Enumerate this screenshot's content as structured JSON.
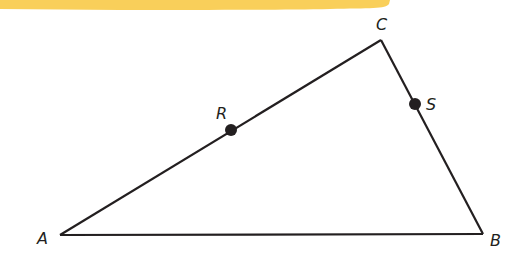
{
  "figure": {
    "type": "triangle",
    "banner_color": "#F9CF5A",
    "stroke_color": "#231f20",
    "vertices": [
      {
        "id": "A",
        "label": "A",
        "x": 60,
        "y": 235
      },
      {
        "id": "B",
        "label": "B",
        "x": 483,
        "y": 234
      },
      {
        "id": "C",
        "label": "C",
        "x": 381,
        "y": 40
      }
    ],
    "points": [
      {
        "id": "R",
        "label": "R",
        "on_segment": "AC",
        "x": 231,
        "y": 130
      },
      {
        "id": "S",
        "label": "S",
        "on_segment": "BC",
        "x": 415,
        "y": 104
      }
    ],
    "labels": {
      "A": "A",
      "B": "B",
      "C": "C",
      "R": "R",
      "S": "S"
    }
  }
}
